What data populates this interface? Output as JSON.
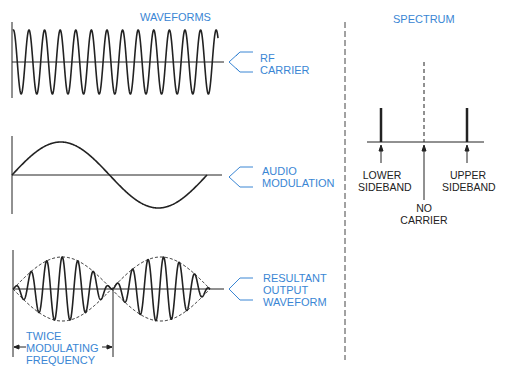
{
  "headings": {
    "waveforms": "WAVEFORMS",
    "spectrum": "SPECTRUM"
  },
  "waveform_labels": {
    "rf_carrier": "RF\nCARRIER",
    "audio_modulation": "AUDIO\nMODULATION",
    "resultant_output": "RESULTANT\nOUTPUT\nWAVEFORM",
    "twice_modulating": "TWICE\nMODULATING\nFREQUENCY"
  },
  "spectrum_labels": {
    "lower_sideband": "LOWER\nSIDEBAND",
    "upper_sideband": "UPPER\nSIDEBAND",
    "no_carrier": "NO\nCARRIER"
  },
  "colors": {
    "label_blue": "#3a86d4",
    "line_black": "#222222"
  }
}
